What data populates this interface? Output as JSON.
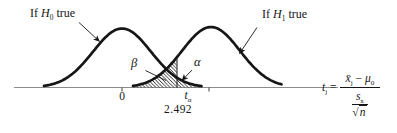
{
  "figure": {
    "annotations": {
      "h0": {
        "prefix": "If",
        "var": "H",
        "sub": "0",
        "suffix": "true"
      },
      "h1": {
        "prefix": "If",
        "var": "H",
        "sub": "1",
        "suffix": "true"
      },
      "beta": "β",
      "alpha": "α"
    },
    "axis": {
      "zero_tick": "0",
      "critical": {
        "var": "t",
        "sub": "α",
        "value": "2.492"
      },
      "axis_label": {
        "var": "t",
        "var_sub": "j",
        "eq": "=",
        "numerator": {
          "xbar": "x̄",
          "xbar_sub": "j",
          "minus": "−",
          "mu": "μ",
          "mu_sub": "0"
        },
        "denominator": {
          "s": "s",
          "s_sub": "x",
          "sqrt": "√",
          "n": "n"
        }
      }
    },
    "colors": {
      "ink": "#161616",
      "axis_line": "#8c8c8c",
      "background": "#ffffff"
    }
  }
}
